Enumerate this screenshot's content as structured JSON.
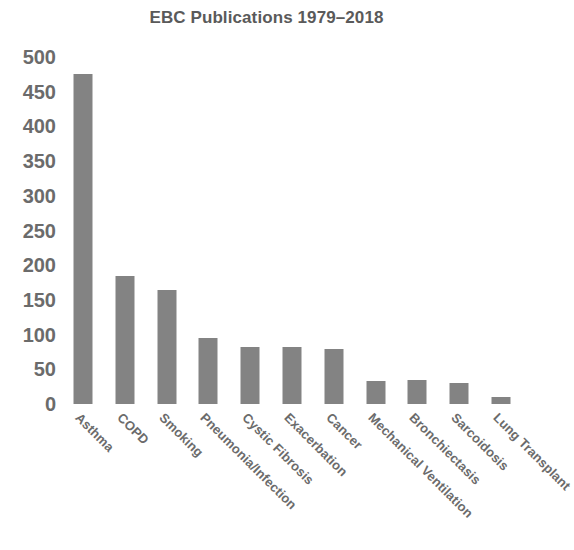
{
  "chart_data": {
    "type": "bar",
    "title": "EBC Publications 1979–2018",
    "xlabel": "",
    "ylabel": "",
    "ylim": [
      0,
      500
    ],
    "ytick_step": 50,
    "yticks": [
      "500",
      "450",
      "400",
      "350",
      "300",
      "250",
      "200",
      "150",
      "100",
      "50",
      "0"
    ],
    "grid": false,
    "legend": false,
    "legend_position": "none",
    "bar_color": "#838383",
    "text_color": "#6b6b6b",
    "background_color": "#ffffff",
    "xtick_rotation": 45,
    "categories": [
      "Asthma",
      "COPD",
      "Smoking",
      "Pneumonia/Infection",
      "Cystic Fibrosis",
      "Exacerbation",
      "Cancer",
      "Mechanical Ventilation",
      "Bronchiectasis",
      "Sarcoidosis",
      "Lung Transplant"
    ],
    "values": [
      475,
      185,
      165,
      95,
      82,
      82,
      79,
      33,
      34,
      30,
      10
    ]
  }
}
